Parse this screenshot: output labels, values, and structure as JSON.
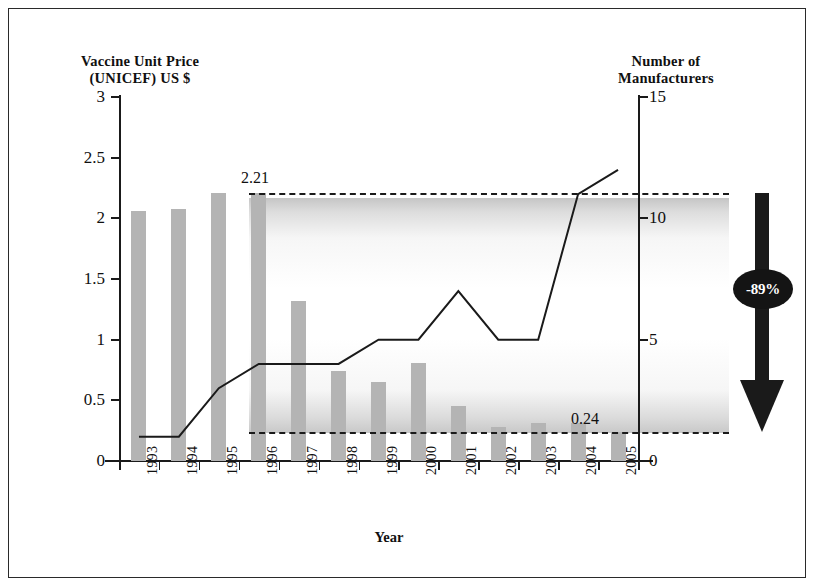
{
  "figure": {
    "left_axis_title": "Vaccine Unit Price\n(UNICEF) US $",
    "right_axis_title": "Number of\nManufacturers",
    "x_axis_title": "Year",
    "callout_label": "-89%",
    "callout_icon": "down-arrow-icon",
    "high_label": "2.21",
    "low_label": "0.24"
  },
  "chart_data": {
    "type": "bar",
    "title": "",
    "subtitle": "",
    "xlabel": "Year",
    "ylabel": "Vaccine Unit Price (UNICEF) US $",
    "y2label": "Number of Manufacturers",
    "grid": false,
    "legend": "none",
    "categories": [
      "1993",
      "1994",
      "1995",
      "1996",
      "1997",
      "1998",
      "1999",
      "2000",
      "2001",
      "2002",
      "2003",
      "2004",
      "2005"
    ],
    "ylim": [
      0,
      3
    ],
    "yticks": [
      "0",
      "0.5",
      "1",
      "1.5",
      "2",
      "2.5",
      "3"
    ],
    "ytick_values": [
      0,
      0.5,
      1,
      1.5,
      2,
      2.5,
      3
    ],
    "y2lim": [
      0,
      15
    ],
    "y2ticks": [
      "0",
      "5",
      "10",
      "15"
    ],
    "y2tick_values": [
      0,
      5,
      10,
      15
    ],
    "series": [
      {
        "name": "Vaccine Unit Price (UNICEF) US $",
        "type": "bar",
        "axis": "left",
        "color": "#b4b4b4",
        "values": [
          2.06,
          2.08,
          2.21,
          2.21,
          1.32,
          0.74,
          0.65,
          0.81,
          0.45,
          0.28,
          0.31,
          0.31,
          0.24
        ]
      },
      {
        "name": "Number of Manufacturers",
        "type": "line",
        "axis": "right",
        "color": "#1a1a1a",
        "values": [
          1,
          1,
          3,
          4,
          4,
          4,
          5,
          5,
          7,
          5,
          5,
          11,
          12
        ]
      }
    ],
    "annotations": [
      {
        "text": "2.21",
        "value": 2.21,
        "axis": "left",
        "style": "dashed-reference-line",
        "at_category": "1996"
      },
      {
        "text": "0.24",
        "value": 0.24,
        "axis": "left",
        "style": "dashed-reference-line",
        "at_category": "2005"
      },
      {
        "text": "-89%",
        "style": "down-arrow-badge",
        "from_value": 2.21,
        "to_value": 0.24
      }
    ]
  }
}
